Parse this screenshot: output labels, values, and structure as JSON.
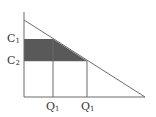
{
  "diagram": {
    "type": "supply-demand-area",
    "y_labels": [
      {
        "base": "C",
        "sub": "1",
        "y": 39
      },
      {
        "base": "C",
        "sub": "2",
        "y": 61
      }
    ],
    "x_labels": [
      {
        "base": "Q",
        "sub": "1",
        "x": 53
      },
      {
        "base": "Q",
        "sub": "1",
        "x": 87
      }
    ],
    "colors": {
      "axis": "#6a6a6a",
      "line": "#6a6a6a",
      "shade": "#595959",
      "text": "#333333",
      "background": "#ffffff"
    }
  }
}
